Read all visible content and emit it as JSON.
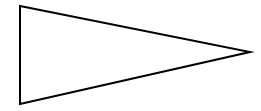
{
  "canvas": {
    "width": 261,
    "height": 111,
    "background_color": "#ffffff",
    "title": "Right-pointing triangle outline"
  },
  "shape": {
    "name": "triangle",
    "description": "Right-pointing triangle (pennant) outline",
    "fill": "none",
    "fill_color": "#ffffff",
    "stroke_color": "#000000",
    "stroke_width": 2,
    "vertices": [
      {
        "label": "top-left",
        "x": 20,
        "y": 6
      },
      {
        "label": "right-tip",
        "x": 250,
        "y": 52
      },
      {
        "label": "bottom-left",
        "x": 20,
        "y": 104
      }
    ],
    "points": "20,6 250,52 20,104",
    "edges": [
      {
        "name": "top-edge",
        "from": "top-left",
        "to": "right-tip"
      },
      {
        "name": "bottom-edge",
        "from": "right-tip",
        "to": "bottom-left"
      },
      {
        "name": "left-edge",
        "from": "bottom-left",
        "to": "top-left"
      }
    ]
  }
}
